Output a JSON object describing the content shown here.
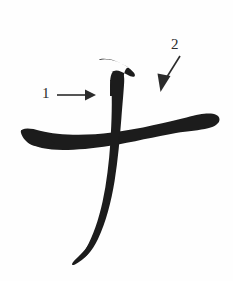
{
  "figure": {
    "character": "才",
    "background_color": "#fefefe",
    "ink_color": "#1c1c1c",
    "annotation_color": "#2b2b2b",
    "width": 233,
    "height": 281
  },
  "strokes": [
    {
      "id": "horizontal-stroke",
      "name": "horizontal-brush-stroke",
      "order": 1,
      "description": "Tapered horizontal stroke rising slightly left to right, ending in a heavy rounded blob on the right"
    },
    {
      "id": "vertical-stroke",
      "name": "vertical-brush-stroke",
      "order": 2,
      "description": "Vertical stroke with angled brush entry at the top, curving left and tapering to a fine point at the bottom"
    }
  ],
  "annotations": [
    {
      "id": "annotation-1",
      "label": "1",
      "arrow": "horizontal-arrow-right",
      "direction": "right",
      "target": "vertical-stroke"
    },
    {
      "id": "annotation-2",
      "label": "2",
      "arrow": "diagonal-arrow-down-left",
      "direction": "down-left",
      "target": "horizontal-stroke"
    }
  ]
}
